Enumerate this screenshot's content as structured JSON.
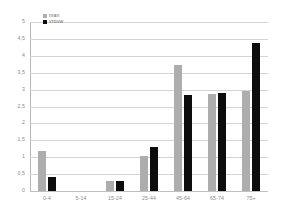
{
  "chart_data": {
    "type": "bar",
    "title": "",
    "subtitle": "",
    "xlabel": "",
    "ylabel": "",
    "categories": [
      "0-4",
      "5-14",
      "15-24",
      "25-44",
      "45-64",
      "65-74",
      "75+"
    ],
    "series": [
      {
        "name": "man",
        "color": "#adadad",
        "values": [
          1.17,
          0,
          0.3,
          1.05,
          3.73,
          2.88,
          2.97
        ]
      },
      {
        "name": "vrouw",
        "color": "#0d0d0d",
        "values": [
          0.42,
          0,
          0.3,
          1.3,
          2.85,
          2.91,
          4.37
        ]
      }
    ],
    "ylim": [
      0,
      5
    ],
    "ytick_step": 0.5,
    "ytick_labels": [
      "5",
      "4,5",
      "4",
      "3,5",
      "3",
      "2,5",
      "2",
      "1,5",
      "1",
      "0,5",
      "0"
    ],
    "ytick_values": [
      5,
      4.5,
      4,
      3.5,
      3,
      2.5,
      2,
      1.5,
      1,
      0.5,
      0
    ],
    "grid": "horizontal",
    "legend_position": "top-left",
    "legend": [
      {
        "label": "man",
        "color": "#adadad",
        "swatch": "square-gray"
      },
      {
        "label": "vrouw",
        "color": "#0d0d0d",
        "swatch": "square-black"
      }
    ],
    "colors": {
      "series_man": "#adadad",
      "series_vrouw": "#0d0d0d",
      "gridline": "#d4d4d4",
      "axis": "#b8b8b8",
      "tick_text": "#8a8a8a",
      "background": "#ffffff"
    }
  }
}
